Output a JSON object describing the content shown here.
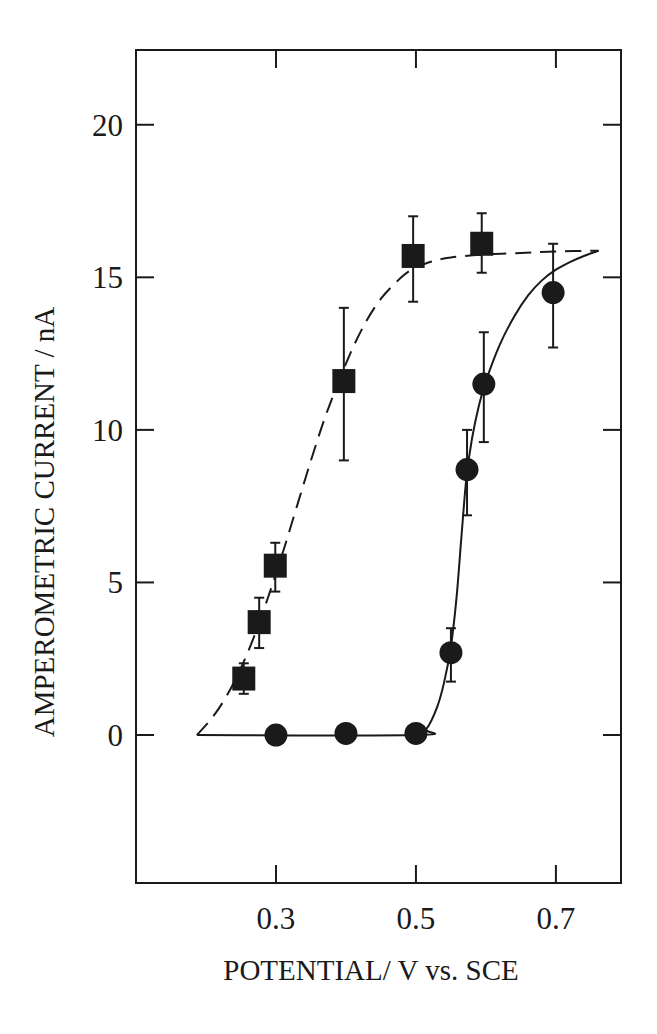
{
  "chart_data": {
    "type": "scatter",
    "title": "",
    "xlabel": "POTENTIAL/ V vs. SCE",
    "ylabel": "AMPEROMETRIC CURRENT / nA",
    "xlim": [
      0.1,
      0.793
    ],
    "ylim": [
      -4.85,
      22.45
    ],
    "x_ticks": [
      0.3,
      0.5,
      0.7
    ],
    "x_tick_labels": [
      "0.3",
      "0.5",
      "0.7"
    ],
    "y_ticks": [
      0,
      5,
      10,
      15,
      20
    ],
    "y_tick_labels": [
      "0",
      "5",
      "10",
      "15",
      "20"
    ],
    "grid": false,
    "legend": null,
    "series": [
      {
        "name": "squares",
        "marker": "square",
        "fit_line_style": "dashed",
        "points": [
          {
            "x": 0.254,
            "y": 1.85,
            "err_low": 1.35,
            "err_high": 2.35
          },
          {
            "x": 0.276,
            "y": 3.7,
            "err_low": 2.85,
            "err_high": 4.5
          },
          {
            "x": 0.299,
            "y": 5.55,
            "err_low": 4.7,
            "err_high": 6.3
          },
          {
            "x": 0.397,
            "y": 11.6,
            "err_low": 9.0,
            "err_high": 14.0
          },
          {
            "x": 0.496,
            "y": 15.7,
            "err_low": 14.2,
            "err_high": 17.0
          },
          {
            "x": 0.594,
            "y": 16.1,
            "err_low": 15.15,
            "err_high": 17.1
          }
        ],
        "fit_curve": [
          [
            0.187,
            0.0
          ],
          [
            0.21,
            0.6
          ],
          [
            0.23,
            1.3
          ],
          [
            0.25,
            2.2
          ],
          [
            0.27,
            3.3
          ],
          [
            0.29,
            4.6
          ],
          [
            0.31,
            6.0
          ],
          [
            0.33,
            7.5
          ],
          [
            0.35,
            9.0
          ],
          [
            0.37,
            10.4
          ],
          [
            0.39,
            11.6
          ],
          [
            0.41,
            12.7
          ],
          [
            0.43,
            13.6
          ],
          [
            0.45,
            14.3
          ],
          [
            0.47,
            14.8
          ],
          [
            0.49,
            15.2
          ],
          [
            0.52,
            15.5
          ],
          [
            0.55,
            15.65
          ],
          [
            0.6,
            15.75
          ],
          [
            0.65,
            15.8
          ],
          [
            0.7,
            15.85
          ],
          [
            0.761,
            15.87
          ]
        ]
      },
      {
        "name": "circles",
        "marker": "circle",
        "fit_line_style": "solid",
        "points": [
          {
            "x": 0.3,
            "y": 0.0
          },
          {
            "x": 0.4,
            "y": 0.05
          },
          {
            "x": 0.5,
            "y": 0.05
          },
          {
            "x": 0.55,
            "y": 2.7,
            "err_low": 1.75,
            "err_high": 3.5
          },
          {
            "x": 0.573,
            "y": 8.7,
            "err_low": 7.2,
            "err_high": 10.0
          },
          {
            "x": 0.597,
            "y": 11.5,
            "err_low": 9.6,
            "err_high": 13.2
          },
          {
            "x": 0.696,
            "y": 14.5,
            "err_low": 12.7,
            "err_high": 16.1
          }
        ],
        "fit_curve": [
          [
            0.187,
            0.0
          ],
          [
            0.5,
            0.0
          ],
          [
            0.515,
            0.2
          ],
          [
            0.53,
            0.9
          ],
          [
            0.54,
            1.7
          ],
          [
            0.55,
            2.9
          ],
          [
            0.558,
            4.5
          ],
          [
            0.565,
            6.5
          ],
          [
            0.572,
            8.4
          ],
          [
            0.58,
            9.7
          ],
          [
            0.59,
            10.8
          ],
          [
            0.6,
            11.6
          ],
          [
            0.62,
            12.8
          ],
          [
            0.64,
            13.7
          ],
          [
            0.66,
            14.4
          ],
          [
            0.68,
            14.9
          ],
          [
            0.7,
            15.25
          ],
          [
            0.72,
            15.5
          ],
          [
            0.74,
            15.7
          ],
          [
            0.761,
            15.87
          ]
        ]
      }
    ]
  },
  "colors": {
    "ink": "#1a1a1a",
    "background": "#ffffff"
  }
}
